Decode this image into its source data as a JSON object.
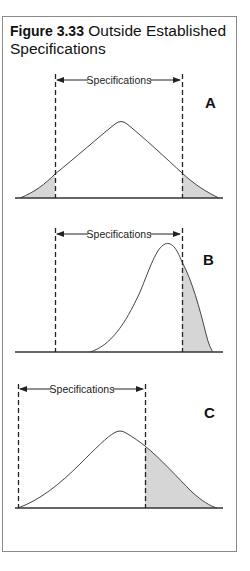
{
  "figure": {
    "number": "Figure 3.33",
    "title": "Outside Established Specifications"
  },
  "panels": [
    {
      "id": "A",
      "letter": "A",
      "spec_label": "Specifications",
      "description": "Symmetric distribution wider than specification limits; both tails shaded outside limits"
    },
    {
      "id": "B",
      "letter": "B",
      "spec_label": "Specifications",
      "description": "Skewed distribution shifted right; right tail shaded beyond upper specification limit"
    },
    {
      "id": "C",
      "letter": "C",
      "spec_label": "Specifications",
      "description": "Symmetric distribution off-center to the right of specifications; right portion shaded beyond upper limit"
    }
  ],
  "colors": {
    "shade": "#d6d6d6",
    "line": "#333333",
    "frame": "#8a8a8a"
  }
}
